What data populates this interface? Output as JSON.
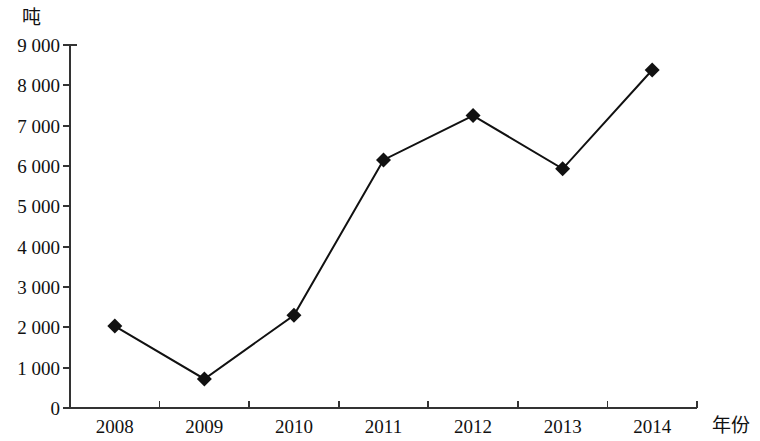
{
  "chart_data": {
    "type": "line",
    "title": "",
    "subtitle": "",
    "xlabel": "年份",
    "ylabel": "吨",
    "categories": [
      "2008",
      "2009",
      "2010",
      "2011",
      "2012",
      "2013",
      "2014"
    ],
    "values": [
      2030,
      720,
      2300,
      6150,
      7250,
      5930,
      8380
    ],
    "series": [
      {
        "name": "",
        "values": [
          2030,
          720,
          2300,
          6150,
          7250,
          5930,
          8380
        ]
      }
    ],
    "ylim": [
      0,
      9000
    ],
    "ytick_labels": [
      "0",
      "1 000",
      "2 000",
      "3 000",
      "4 000",
      "5 000",
      "6 000",
      "7 000",
      "8 000",
      "9 000"
    ],
    "ytick_values": [
      0,
      1000,
      2000,
      3000,
      4000,
      5000,
      6000,
      7000,
      8000,
      9000
    ],
    "xtick_labels": [
      "2008",
      "2009",
      "2010",
      "2011",
      "2012",
      "2013",
      "2014"
    ],
    "grid": false,
    "legend": false,
    "legend_position": "none",
    "marker": "diamond",
    "line_color": "#111111",
    "marker_color": "#111111",
    "axis_color": "#333333",
    "background_color": "#ffffff"
  }
}
